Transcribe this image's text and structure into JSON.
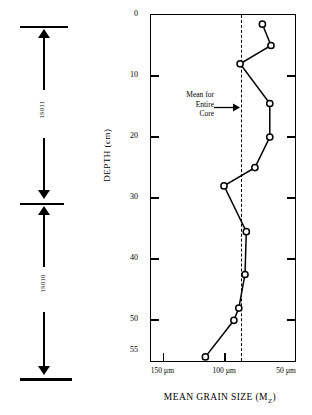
{
  "core_scale": {
    "sections": [
      {
        "label": "1S011",
        "name": "core-section-upper"
      },
      {
        "label": "1S010",
        "name": "core-section-lower"
      }
    ]
  },
  "annotation": {
    "line1": "Mean for",
    "line2": "Entire",
    "line3": "Core"
  },
  "chart_data": {
    "type": "line",
    "title": "",
    "xlabel": "MEAN GRAIN SIZE (M",
    "xlabel_sub": "Z",
    "xlabel_close": ")",
    "ylabel": "DEPTH (cm)",
    "x_ticks": [
      150,
      100,
      50
    ],
    "x_tick_labels": [
      "150 µm",
      "100 µm",
      "50 µm"
    ],
    "xlim": [
      160,
      42
    ],
    "y_ticks": [
      0,
      10,
      20,
      30,
      40,
      50,
      55
    ],
    "y_tick_labels": [
      "0",
      "10",
      "20",
      "30",
      "40",
      "50",
      "55"
    ],
    "ylim": [
      0,
      57
    ],
    "grid": false,
    "legend": false,
    "marker": "open-circle",
    "mean_value": 87,
    "mean_label": "Mean for Entire Core",
    "series": [
      {
        "name": "Mean grain size profile",
        "depth_cm": [
          1.5,
          5,
          8,
          14.5,
          20,
          25,
          28,
          35.5,
          42.5,
          48,
          50,
          56
        ],
        "grain_size_um": [
          70,
          63,
          88,
          64,
          64,
          76,
          101,
          83,
          84,
          89,
          93,
          116
        ]
      }
    ]
  }
}
